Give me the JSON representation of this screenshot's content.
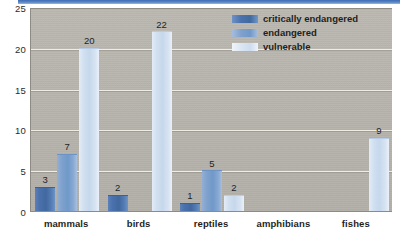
{
  "chart_data": {
    "type": "bar",
    "title": "",
    "xlabel": "",
    "ylabel": "",
    "ylim": [
      0,
      25
    ],
    "yticks": [
      0,
      5,
      10,
      15,
      20,
      25
    ],
    "grid": true,
    "legend_position": "top-right",
    "categories": [
      "mammals",
      "birds",
      "reptiles",
      "amphibians",
      "fishes"
    ],
    "series": [
      {
        "name": "critically endangered",
        "color": "#4a71ad",
        "values": [
          3,
          2,
          1,
          0,
          0
        ],
        "labels": [
          "3",
          "2",
          "1",
          "",
          ""
        ]
      },
      {
        "name": "endangered",
        "color": "#7ea1cd",
        "values": [
          7,
          0,
          5,
          0,
          0
        ],
        "labels": [
          "7",
          "",
          "5",
          "",
          ""
        ]
      },
      {
        "name": "vulnerable",
        "color": "#cddcef",
        "values": [
          20,
          22,
          2,
          0,
          9
        ],
        "labels": [
          "20",
          "22",
          "2",
          "",
          "9"
        ]
      }
    ]
  },
  "axes": {
    "y_tick_labels": [
      "0",
      "5",
      "10",
      "15",
      "20",
      "25"
    ],
    "x_tick_labels": [
      "mammals",
      "birds",
      "reptiles",
      "amphibians",
      "fishes"
    ]
  },
  "legend": {
    "items": [
      {
        "label": "critically endangered",
        "color": "#4a71ad"
      },
      {
        "label": "endangered",
        "color": "#7ea1cd"
      },
      {
        "label": "vulnerable",
        "color": "#cddcef"
      }
    ]
  },
  "colors": {
    "plot_background": "#b6b3ac",
    "page_background": "#ffffff",
    "gridline": "#efece4",
    "axis_line": "#8e8b85",
    "top_strip": "#3c6db5",
    "text": "#1f1f1c"
  }
}
